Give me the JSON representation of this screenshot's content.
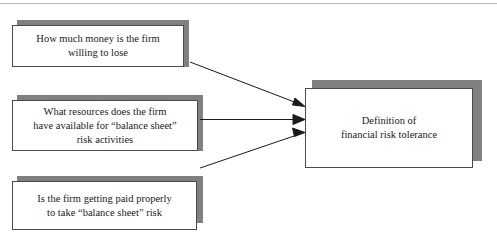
{
  "diagram": {
    "title": "",
    "colors": {
      "box_border": "#4a4a4a",
      "box_fill": "#ffffff",
      "shadow": "#808080",
      "arrow": "#1a1a1a",
      "rule": "#b9b9b9"
    },
    "sources": [
      {
        "id": "money-box",
        "text": "How much money is the firm\nwilling to lose"
      },
      {
        "id": "resources-box",
        "text": "What resources does the firm\nhave available for “balance sheet”\nrisk activities"
      },
      {
        "id": "paid-box",
        "text": "Is the firm getting paid properly\nto take “balance sheet” risk"
      }
    ],
    "target": {
      "id": "definition-box",
      "text": "Definition of\nfinancial risk tolerance"
    },
    "connectors": [
      {
        "id": "arrow-money-to-definition",
        "from": "money-box",
        "to": "definition-box"
      },
      {
        "id": "arrow-resources-to-definition",
        "from": "resources-box",
        "to": "definition-box"
      },
      {
        "id": "arrow-paid-to-definition",
        "from": "paid-box",
        "to": "definition-box"
      }
    ]
  }
}
